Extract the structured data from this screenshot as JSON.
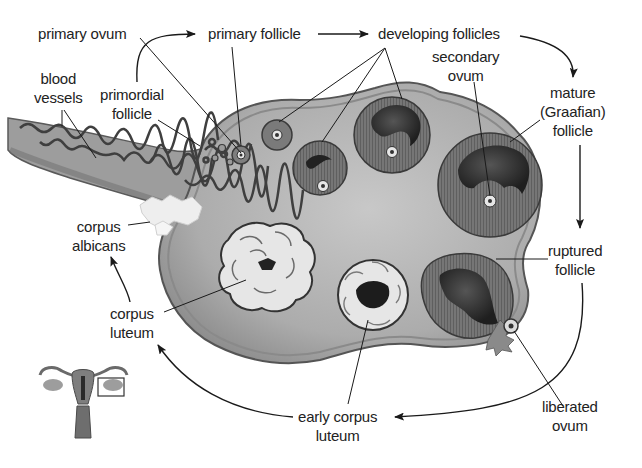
{
  "diagram": {
    "background": "#ffffff",
    "colors": {
      "ovary_fill": "#a9a9a9",
      "ovary_edge": "#5e5e5e",
      "follicle_ring": "#6d6d6d",
      "antrum": "#2b2b2b",
      "corpus_luteum": "#e4e4e4",
      "text": "#222222",
      "arrow": "#1a1a1a"
    },
    "labels": {
      "primary_ovum": "primary ovum",
      "primary_follicle": "primary follicle",
      "developing_follicles": "developing follicles",
      "blood_vessels": [
        "blood",
        "vessels"
      ],
      "primordial_follicle": [
        "primordial",
        "follicle"
      ],
      "secondary_ovum": [
        "secondary",
        "ovum"
      ],
      "mature_follicle": [
        "mature",
        "(Graafian)",
        "follicle"
      ],
      "corpus_albicans": [
        "corpus",
        "albicans"
      ],
      "ruptured_follicle": [
        "ruptured",
        "follicle"
      ],
      "corpus_luteum": [
        "corpus",
        "luteum"
      ],
      "early_corpus_luteum": [
        "early corpus",
        "luteum"
      ],
      "liberated_ovum": [
        "liberated",
        "ovum"
      ]
    },
    "cycle_sequence": [
      "primordial follicle",
      "primary follicle",
      "developing follicles",
      "mature (Graafian) follicle",
      "ruptured follicle",
      "early corpus luteum",
      "corpus luteum",
      "corpus albicans"
    ],
    "inset": {
      "description": "uterus with ovaries, box highlighting right ovary",
      "icon": "uterus-inset-icon"
    }
  }
}
